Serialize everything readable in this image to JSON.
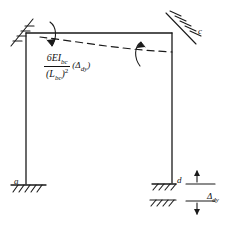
{
  "diagram": {
    "type": "structural-frame-deflection",
    "stroke_color": "#1a1a1a",
    "background": "#ffffff"
  },
  "labels": {
    "node_a": "a",
    "node_c": "c",
    "node_d": "d",
    "settlement": "Δ",
    "settlement_sub": "dy"
  },
  "formula": {
    "numerator_main": "6EI",
    "numerator_sub": "bc",
    "denominator_main": "(L",
    "denominator_sub": "bc",
    "denominator_close": ")",
    "denominator_exp": "2",
    "multiplier_open": "(Δ",
    "multiplier_sub": "dy",
    "multiplier_close": ")",
    "plain": "6EI_bc / (L_bc)^2 (Δ_dy)"
  },
  "geometry": {
    "frame": {
      "top_left": [
        26,
        33
      ],
      "top_right": [
        172,
        33
      ],
      "bottom_left": [
        26,
        184
      ],
      "bottom_right": [
        172,
        182
      ]
    },
    "deflected_shape": {
      "style": "dashed",
      "start": [
        38,
        36
      ],
      "end": [
        172,
        52
      ],
      "description": "beam bc deflects downward toward support d"
    },
    "moment_arrows": [
      {
        "name": "moment-arrow-b",
        "at": [
          54,
          36
        ],
        "direction": "clockwise"
      },
      {
        "name": "moment-arrow-c",
        "at": [
          139,
          52
        ],
        "direction": "counterclockwise"
      }
    ],
    "supports": [
      {
        "name": "support-b-fixed",
        "at": [
          26,
          33
        ],
        "kind": "hatched-inclined"
      },
      {
        "name": "support-c-fixed",
        "at": [
          172,
          33
        ],
        "kind": "hatched-diagonal"
      },
      {
        "name": "support-a-fixed",
        "at": [
          26,
          184
        ],
        "kind": "ground-hatch"
      },
      {
        "name": "support-d-fixed",
        "at": [
          172,
          182
        ],
        "kind": "ground-hatch-settled"
      }
    ],
    "dimension": {
      "name": "settlement-dimension",
      "top_line_y": 184,
      "bottom_line_y": 203,
      "x_from": 186,
      "x_to": 215
    }
  }
}
